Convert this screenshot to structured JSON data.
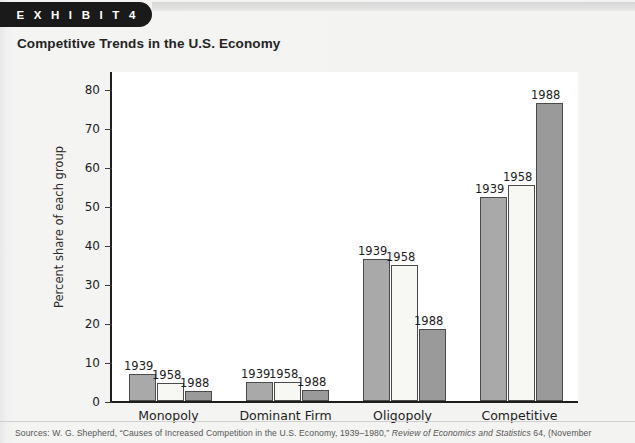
{
  "banner": {
    "label": "E X H I B I T   4"
  },
  "title": "Competitive Trends in the U.S. Economy",
  "source": {
    "prefix": "Sources: W. G. Shepherd, “Causes of Increased Competition in the U.S. Economy, 1939–1980,” ",
    "italic": "Review of Economics and Statistics",
    "suffix": " 64, (November"
  },
  "colors": {
    "series_1939": "#a9a9a9",
    "series_1958": "#f7f7f4",
    "series_1988": "#9a9a9a",
    "axis": "#1e1e1e",
    "banner": "#1a1a1a",
    "page_background": "#f3f3f2",
    "plot_background": "#ffffff"
  },
  "chart_data": {
    "type": "bar",
    "title": "Competitive Trends in the U.S. Economy",
    "xlabel": "",
    "ylabel": "Percent share of each group",
    "ylim": [
      0,
      85
    ],
    "yticks": [
      0,
      10,
      20,
      30,
      40,
      50,
      60,
      70,
      80
    ],
    "ytick_labels": [
      "0",
      "10",
      "20",
      "30",
      "40",
      "50",
      "60",
      "70",
      "80"
    ],
    "grid": false,
    "legend": "none",
    "data_labels": true,
    "categories": [
      "Monopoly",
      "Dominant Firm",
      "Oligopoly",
      "Competitive"
    ],
    "series": [
      {
        "name": "1939",
        "values": [
          7.0,
          5.0,
          36.5,
          52.5
        ]
      },
      {
        "name": "1958",
        "values": [
          4.5,
          5.0,
          35.0,
          55.5
        ]
      },
      {
        "name": "1988",
        "values": [
          2.5,
          2.8,
          18.5,
          76.5
        ]
      }
    ]
  }
}
